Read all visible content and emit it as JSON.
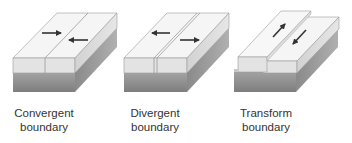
{
  "diagram": {
    "blocks": [
      {
        "id": "convergent",
        "label_line1": "Convergent",
        "label_line2": "boundary",
        "arrows": "toward each other"
      },
      {
        "id": "divergent",
        "label_line1": "Divergent",
        "label_line2": "boundary",
        "arrows": "away from each other"
      },
      {
        "id": "transform",
        "label_line1": "Transform",
        "label_line2": "boundary",
        "arrows": "sliding past each other"
      }
    ],
    "colors": {
      "top_face": "#f4f4f4",
      "front_light": "#e2e2e2",
      "front_dark": "#8e8e8e",
      "side_light": "#cfcfcf",
      "side_dark": "#7a7a7a",
      "edge": "#9a9a9a",
      "arrow": "#333333"
    }
  }
}
